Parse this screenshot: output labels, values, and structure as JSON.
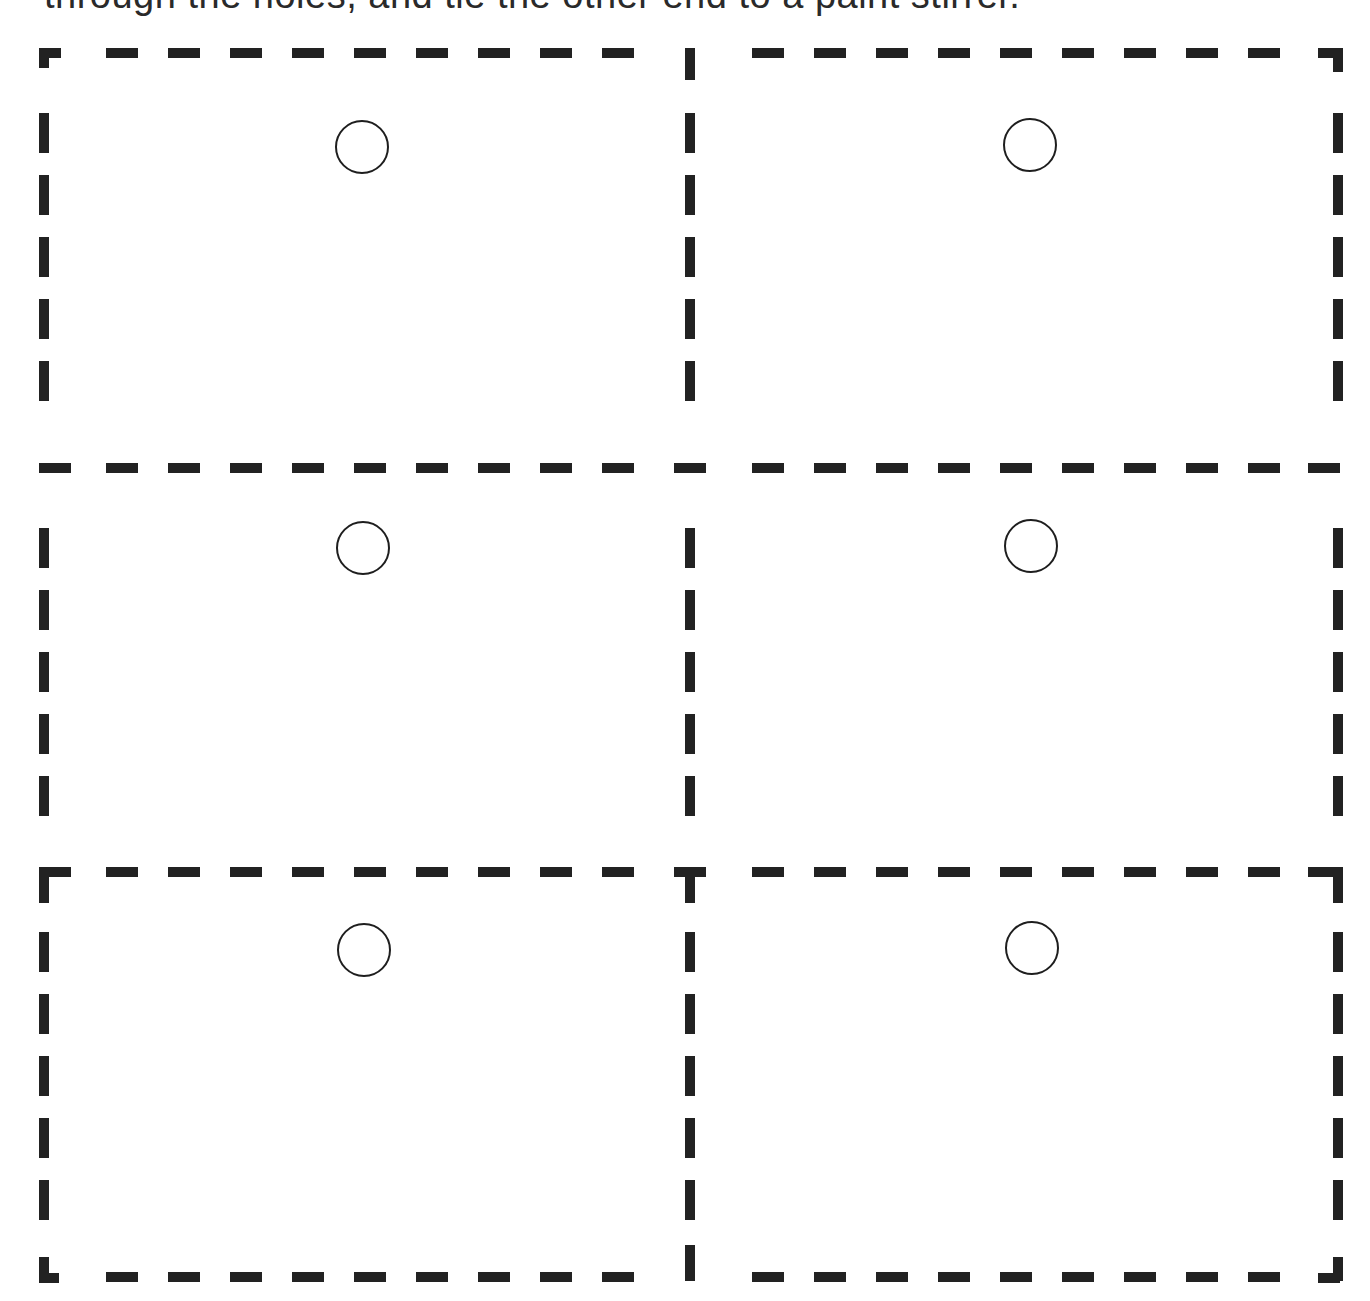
{
  "instruction": {
    "text": "through the holes, and tie the other end to a paint stirrer."
  },
  "template": {
    "line_color": "#222222",
    "hole_color": "#1e1e1e",
    "background": "#ffffff",
    "grid": {
      "columns": 2,
      "rows": 3
    },
    "frame": {
      "left": 44,
      "top": 53,
      "right": 1338,
      "bottom": 1277
    },
    "dividers": {
      "vertical_x": 690,
      "horizontal_y": [
        468,
        872
      ]
    },
    "dash": {
      "length": 32,
      "gap": 30,
      "thickness": 10
    },
    "cards": [
      {
        "id": "card-1",
        "row": 1,
        "column": 1,
        "hole": {
          "cx": 362,
          "cy": 147,
          "r": 27
        }
      },
      {
        "id": "card-2",
        "row": 1,
        "column": 2,
        "hole": {
          "cx": 1030,
          "cy": 145,
          "r": 27
        }
      },
      {
        "id": "card-3",
        "row": 2,
        "column": 1,
        "hole": {
          "cx": 363,
          "cy": 548,
          "r": 27
        }
      },
      {
        "id": "card-4",
        "row": 2,
        "column": 2,
        "hole": {
          "cx": 1031,
          "cy": 546,
          "r": 27
        }
      },
      {
        "id": "card-5",
        "row": 3,
        "column": 1,
        "hole": {
          "cx": 364,
          "cy": 950,
          "r": 27
        }
      },
      {
        "id": "card-6",
        "row": 3,
        "column": 2,
        "hole": {
          "cx": 1032,
          "cy": 948,
          "r": 27
        }
      }
    ]
  }
}
